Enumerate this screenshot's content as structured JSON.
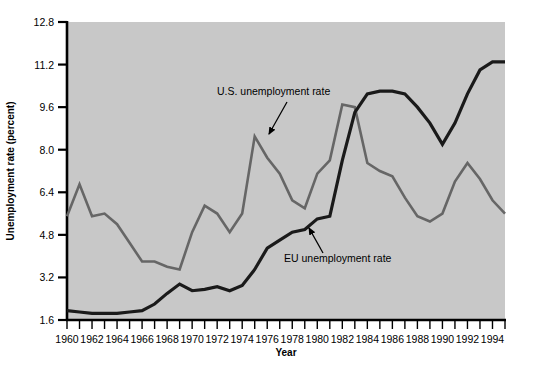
{
  "chart_data": {
    "type": "line",
    "title": "",
    "xlabel": "Year",
    "ylabel": "Unemployment rate (percent)",
    "xlim": [
      1960,
      1995
    ],
    "ylim": [
      1.6,
      12.8
    ],
    "grid": false,
    "legend_position": "inline-annotations",
    "plot_background": "#c8c8c8",
    "x": [
      1960,
      1961,
      1962,
      1963,
      1964,
      1965,
      1966,
      1967,
      1968,
      1969,
      1970,
      1971,
      1972,
      1973,
      1974,
      1975,
      1976,
      1977,
      1978,
      1979,
      1980,
      1981,
      1982,
      1983,
      1984,
      1985,
      1986,
      1987,
      1988,
      1989,
      1990,
      1991,
      1992,
      1993,
      1994,
      1995
    ],
    "xticks": [
      1960,
      1962,
      1964,
      1966,
      1968,
      1970,
      1972,
      1974,
      1976,
      1978,
      1980,
      1982,
      1984,
      1986,
      1988,
      1990,
      1992,
      1994
    ],
    "xtick_labels": [
      "1960",
      "1962",
      "1964",
      "1966",
      "1968",
      "1970",
      "1972",
      "1974",
      "1976",
      "1978",
      "1980",
      "1982",
      "1984",
      "1986",
      "1988",
      "1990",
      "1992",
      "1994"
    ],
    "yticks": [
      1.6,
      3.2,
      4.8,
      6.4,
      8.0,
      9.6,
      11.2,
      12.8
    ],
    "ytick_labels": [
      "1.6",
      "3.2",
      "4.8",
      "6.4",
      "8.0",
      "9.6",
      "11.2",
      "12.8"
    ],
    "series": [
      {
        "name": "U.S. unemployment rate",
        "color": "#666666",
        "width": 2.6,
        "values": [
          5.5,
          6.7,
          5.5,
          5.6,
          5.2,
          4.5,
          3.8,
          3.8,
          3.6,
          3.5,
          4.9,
          5.9,
          5.6,
          4.9,
          5.6,
          8.5,
          7.7,
          7.1,
          6.1,
          5.8,
          7.1,
          7.6,
          9.7,
          9.6,
          7.5,
          7.2,
          7.0,
          6.2,
          5.5,
          5.3,
          5.6,
          6.8,
          7.5,
          6.9,
          6.1,
          5.6
        ]
      },
      {
        "name": "EU unemployment rate",
        "color": "#1a1a1a",
        "width": 3.2,
        "values": [
          1.95,
          1.9,
          1.85,
          1.85,
          1.85,
          1.9,
          1.95,
          2.2,
          2.6,
          2.95,
          2.7,
          2.75,
          2.85,
          2.7,
          2.9,
          3.5,
          4.3,
          4.6,
          4.9,
          5.0,
          5.4,
          5.5,
          7.6,
          9.4,
          10.1,
          10.2,
          10.2,
          10.1,
          9.6,
          9.0,
          8.2,
          9.0,
          10.1,
          11.0,
          11.3,
          11.3
        ]
      }
    ],
    "annotations": [
      {
        "id": "us-annotation",
        "text": "U.S. unemployment rate",
        "label_x": 217,
        "label_y": 95,
        "arrow_from_x": 287,
        "arrow_from_y": 102,
        "arrow_to_x": 269,
        "arrow_to_y": 134
      },
      {
        "id": "eu-annotation",
        "text": "EU unemployment rate",
        "label_x": 284,
        "label_y": 262,
        "arrow_from_x": 323,
        "arrow_from_y": 253,
        "arrow_to_x": 309,
        "arrow_to_y": 228
      }
    ]
  }
}
